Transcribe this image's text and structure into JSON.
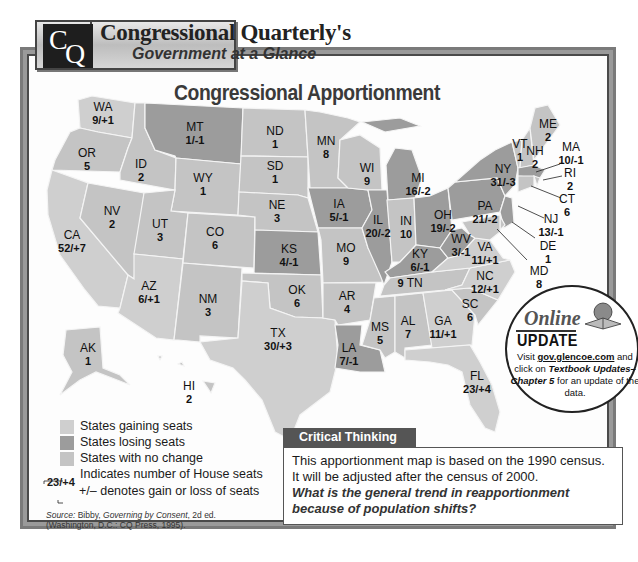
{
  "header": {
    "logo": {
      "letter1": "C",
      "letter2": "Q"
    },
    "title": "Congressional Quarterly's",
    "subtitle": "Government at a Glance"
  },
  "map": {
    "title": "Congressional Apportionment",
    "colors": {
      "gain": "#cfcfcf",
      "lose": "#9c9c9c",
      "none": "#c4c4c4"
    },
    "states": [
      {
        "abbr": "WA",
        "value": "9/+1",
        "status": "gain"
      },
      {
        "abbr": "OR",
        "value": "5",
        "status": "none"
      },
      {
        "abbr": "CA",
        "value": "52/+7",
        "status": "gain"
      },
      {
        "abbr": "ID",
        "value": "2",
        "status": "none"
      },
      {
        "abbr": "NV",
        "value": "2",
        "status": "none"
      },
      {
        "abbr": "MT",
        "value": "1/-1",
        "status": "lose"
      },
      {
        "abbr": "WY",
        "value": "1",
        "status": "none"
      },
      {
        "abbr": "UT",
        "value": "3",
        "status": "none"
      },
      {
        "abbr": "AZ",
        "value": "6/+1",
        "status": "gain"
      },
      {
        "abbr": "CO",
        "value": "6",
        "status": "none"
      },
      {
        "abbr": "NM",
        "value": "3",
        "status": "none"
      },
      {
        "abbr": "ND",
        "value": "1",
        "status": "none"
      },
      {
        "abbr": "SD",
        "value": "1",
        "status": "none"
      },
      {
        "abbr": "NE",
        "value": "3",
        "status": "none"
      },
      {
        "abbr": "KS",
        "value": "4/-1",
        "status": "lose"
      },
      {
        "abbr": "OK",
        "value": "6",
        "status": "none"
      },
      {
        "abbr": "TX",
        "value": "30/+3",
        "status": "gain"
      },
      {
        "abbr": "MN",
        "value": "8",
        "status": "none"
      },
      {
        "abbr": "IA",
        "value": "5/-1",
        "status": "lose"
      },
      {
        "abbr": "MO",
        "value": "9",
        "status": "none"
      },
      {
        "abbr": "AR",
        "value": "4",
        "status": "none"
      },
      {
        "abbr": "LA",
        "value": "7/-1",
        "status": "lose"
      },
      {
        "abbr": "WI",
        "value": "9",
        "status": "none"
      },
      {
        "abbr": "IL",
        "value": "20/-2",
        "status": "lose"
      },
      {
        "abbr": "MI",
        "value": "16/-2",
        "status": "lose"
      },
      {
        "abbr": "IN",
        "value": "10",
        "status": "none"
      },
      {
        "abbr": "OH",
        "value": "19/-2",
        "status": "lose"
      },
      {
        "abbr": "KY",
        "value": "6/-1",
        "status": "lose"
      },
      {
        "abbr": "TN",
        "value": "9",
        "status": "none"
      },
      {
        "abbr": "MS",
        "value": "5",
        "status": "none"
      },
      {
        "abbr": "AL",
        "value": "7",
        "status": "none"
      },
      {
        "abbr": "GA",
        "value": "11/+1",
        "status": "gain"
      },
      {
        "abbr": "FL",
        "value": "23/+4",
        "status": "gain"
      },
      {
        "abbr": "SC",
        "value": "6",
        "status": "none"
      },
      {
        "abbr": "NC",
        "value": "12/+1",
        "status": "gain"
      },
      {
        "abbr": "VA",
        "value": "11/+1",
        "status": "gain"
      },
      {
        "abbr": "WV",
        "value": "3/-1",
        "status": "lose"
      },
      {
        "abbr": "PA",
        "value": "21/-2",
        "status": "lose"
      },
      {
        "abbr": "NY",
        "value": "31/-3",
        "status": "lose"
      },
      {
        "abbr": "VT",
        "value": "1",
        "status": "none"
      },
      {
        "abbr": "NH",
        "value": "2",
        "status": "none"
      },
      {
        "abbr": "ME",
        "value": "2",
        "status": "none"
      },
      {
        "abbr": "MA",
        "value": "10/-1",
        "status": "lose"
      },
      {
        "abbr": "RI",
        "value": "2",
        "status": "none"
      },
      {
        "abbr": "CT",
        "value": "6",
        "status": "none"
      },
      {
        "abbr": "NJ",
        "value": "13/-1",
        "status": "lose"
      },
      {
        "abbr": "DE",
        "value": "1",
        "status": "none"
      },
      {
        "abbr": "MD",
        "value": "8",
        "status": "none"
      },
      {
        "abbr": "AK",
        "value": "1",
        "status": "none"
      },
      {
        "abbr": "HI",
        "value": "2",
        "status": "none"
      }
    ]
  },
  "legend": {
    "items": [
      {
        "label": "States gaining seats",
        "status": "gain"
      },
      {
        "label": "States losing seats",
        "status": "lose"
      },
      {
        "label": "States with no change",
        "status": "none"
      }
    ],
    "example_value": "23/+4",
    "seats_note": "Indicates number of House seats",
    "change_note": "+/– denotes gain or loss of seats"
  },
  "source": {
    "prefix": "Source:",
    "text1": " Bibby, ",
    "title": "Governing by Consent",
    "text2": ", 2d ed.",
    "line2": "(Washington, D.C.: CQ Press, 1995)."
  },
  "critical_thinking": {
    "heading": "Critical Thinking",
    "line1": "This apportionment map is based on the 1990 census.",
    "line2": "It will be adjusted after the census of 2000.",
    "question": "What is the general trend in reapportionment because of population shifts?"
  },
  "online_update": {
    "online": "Online",
    "update": "UPDATE",
    "visit": "Visit ",
    "link": "gov.glencoe.com",
    "and": " and click on ",
    "bold": "Textbook Updates–",
    "chapter": "Chapter 5",
    "rest": " for an update of the data."
  }
}
